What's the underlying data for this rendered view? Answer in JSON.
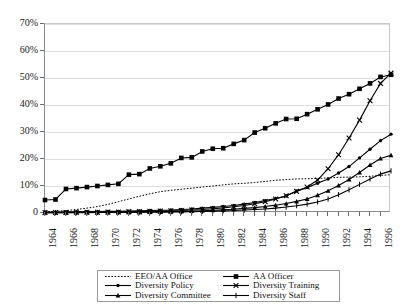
{
  "chart_data": {
    "type": "line",
    "title": "",
    "subtitle": "",
    "xlabel": "",
    "ylabel": "",
    "xlim": [
      1964,
      1997
    ],
    "ylim": [
      0,
      70
    ],
    "y_tick_labels": [
      "0",
      "10%",
      "20%",
      "30%",
      "40%",
      "50%",
      "60%",
      "70%"
    ],
    "y_tick_values": [
      0,
      10,
      20,
      30,
      40,
      50,
      60,
      70
    ],
    "x_tick_labels": [
      "1964",
      "1966",
      "1968",
      "1970",
      "1972",
      "1974",
      "1976",
      "1978",
      "1980",
      "1982",
      "1984",
      "1986",
      "1988",
      "1990",
      "1992",
      "1994",
      "1996"
    ],
    "x_tick_values": [
      1964,
      1966,
      1968,
      1970,
      1972,
      1974,
      1976,
      1978,
      1980,
      1982,
      1984,
      1986,
      1988,
      1990,
      1992,
      1994,
      1996
    ],
    "x": [
      1964,
      1965,
      1966,
      1967,
      1968,
      1969,
      1970,
      1971,
      1972,
      1973,
      1974,
      1975,
      1976,
      1977,
      1978,
      1979,
      1980,
      1981,
      1982,
      1983,
      1984,
      1985,
      1986,
      1987,
      1988,
      1989,
      1990,
      1991,
      1992,
      1993,
      1994,
      1995,
      1996,
      1997
    ],
    "grid": "horizontal",
    "legend_position": "bottom",
    "series": [
      {
        "name": "EEO/AA Office",
        "marker": "none",
        "line_style": "dotted",
        "color": "#000000",
        "values": [
          0.4,
          0.6,
          0.9,
          1.3,
          1.8,
          2.4,
          3.2,
          4.2,
          5.2,
          6.2,
          7.1,
          7.9,
          8.4,
          8.8,
          9.2,
          9.6,
          10.0,
          10.4,
          10.8,
          11.0,
          11.3,
          11.7,
          12.1,
          12.4,
          12.6,
          12.7,
          12.8,
          13.0,
          13.2,
          13.3,
          13.4,
          13.6,
          13.9,
          14.2
        ]
      },
      {
        "name": "AA Officer",
        "marker": "square",
        "line_style": "solid",
        "color": "#000000",
        "values": [
          4.8,
          5.0,
          8.9,
          9.2,
          9.6,
          10.0,
          10.4,
          10.8,
          14.2,
          14.4,
          16.5,
          17.3,
          18.4,
          20.4,
          20.6,
          22.8,
          23.8,
          24.0,
          25.6,
          27.0,
          29.8,
          31.4,
          33.2,
          34.8,
          34.9,
          36.6,
          38.4,
          40.2,
          42.4,
          44.0,
          46.0,
          48.0,
          50.4,
          51.2
        ]
      },
      {
        "name": "Diversity Policy",
        "marker": "dot",
        "line_style": "solid",
        "color": "#000000",
        "values": [
          0.3,
          0.3,
          0.4,
          0.4,
          0.5,
          0.5,
          0.6,
          0.6,
          0.7,
          0.8,
          0.9,
          1.0,
          1.1,
          1.3,
          1.5,
          1.8,
          2.1,
          2.4,
          2.8,
          3.3,
          3.9,
          4.6,
          5.4,
          6.3,
          8.2,
          9.4,
          11.0,
          12.6,
          14.8,
          17.2,
          20.4,
          23.6,
          26.8,
          29.2
        ]
      },
      {
        "name": "Diversity Training",
        "marker": "x",
        "line_style": "solid",
        "color": "#000000",
        "values": [
          0.2,
          0.2,
          0.2,
          0.3,
          0.3,
          0.3,
          0.4,
          0.4,
          0.5,
          0.5,
          0.6,
          0.7,
          0.8,
          0.9,
          1.1,
          1.3,
          1.6,
          1.9,
          2.3,
          2.8,
          3.4,
          4.2,
          5.2,
          6.4,
          8.0,
          9.6,
          12.2,
          16.4,
          21.6,
          27.8,
          34.4,
          41.6,
          48.0,
          51.8
        ]
      },
      {
        "name": "Diversity Committee",
        "marker": "triangle",
        "line_style": "solid",
        "color": "#000000",
        "values": [
          0.1,
          0.1,
          0.1,
          0.2,
          0.2,
          0.2,
          0.2,
          0.3,
          0.3,
          0.3,
          0.4,
          0.4,
          0.5,
          0.6,
          0.7,
          0.8,
          1.0,
          1.2,
          1.4,
          1.7,
          2.0,
          2.4,
          2.9,
          3.5,
          4.3,
          5.2,
          6.6,
          8.2,
          10.2,
          12.4,
          15.0,
          17.8,
          20.2,
          21.4
        ]
      },
      {
        "name": "Diversity Staff",
        "marker": "plus",
        "line_style": "solid",
        "color": "#000000",
        "values": [
          0.1,
          0.1,
          0.1,
          0.1,
          0.1,
          0.2,
          0.2,
          0.2,
          0.2,
          0.3,
          0.3,
          0.3,
          0.4,
          0.4,
          0.5,
          0.6,
          0.7,
          0.8,
          0.9,
          1.1,
          1.3,
          1.5,
          1.8,
          2.2,
          2.7,
          3.3,
          4.1,
          5.2,
          6.8,
          8.6,
          10.6,
          12.6,
          14.4,
          15.6
        ]
      }
    ]
  },
  "legend": {
    "entries": [
      {
        "label": "EEO/AA Office",
        "marker": "none",
        "style": "dotted"
      },
      {
        "label": "AA Officer",
        "marker": "square",
        "style": "solid"
      },
      {
        "label": "Diversity Policy",
        "marker": "dot",
        "style": "solid"
      },
      {
        "label": "Diversity Training",
        "marker": "x",
        "style": "solid"
      },
      {
        "label": "Diversity Committee",
        "marker": "triangle",
        "style": "solid"
      },
      {
        "label": "Diversity Staff",
        "marker": "plus",
        "style": "solid"
      }
    ]
  }
}
